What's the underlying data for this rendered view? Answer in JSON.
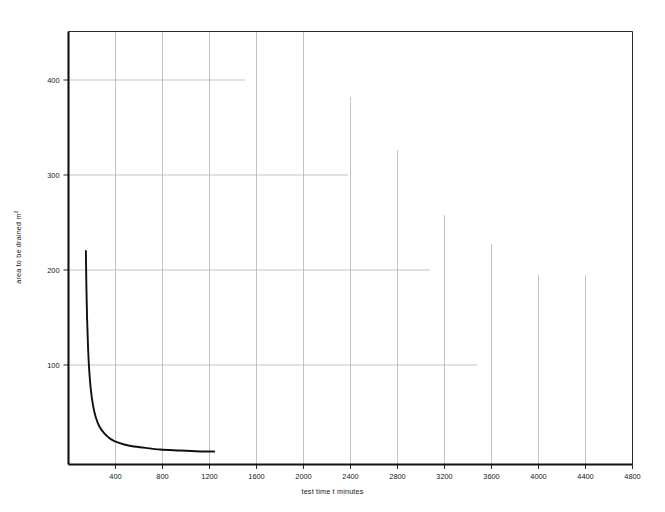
{
  "chart_data": {
    "type": "line",
    "title": "",
    "subtitle": "",
    "xlabel": "test time t minutes",
    "ylabel": "area to be drained m",
    "ylabel_superscript": "2",
    "xlim": [
      0,
      4800
    ],
    "ylim": [
      0,
      455
    ],
    "xticks": [
      400,
      800,
      1200,
      1600,
      2000,
      2400,
      2800,
      3200,
      3600,
      4000,
      4400,
      4800
    ],
    "xtick_labels": [
      "400",
      "800",
      "1200",
      "1600",
      "2000",
      "2400",
      "2800",
      "3200",
      "3600",
      "4000",
      "4400",
      "4800"
    ],
    "yticks": [
      100,
      200,
      300,
      400
    ],
    "ytick_labels": [
      "100",
      "200",
      "300",
      "400"
    ],
    "grid": true,
    "grid_style": "staggered-partial",
    "legend_position": "inline-curve-labels",
    "annotations": [
      {
        "name": "definition-note",
        "text": "D = diameter and effective depth",
        "x": 2750,
        "y": 332
      }
    ],
    "series": [
      {
        "name": "D = 1·0",
        "label": "D=1·0",
        "label_x": 560,
        "label_y": 38,
        "color": "#101010",
        "points": [
          [
            148,
            220
          ],
          [
            152,
            185
          ],
          [
            158,
            150
          ],
          [
            166,
            120
          ],
          [
            176,
            95
          ],
          [
            190,
            74
          ],
          [
            208,
            58
          ],
          [
            232,
            45
          ],
          [
            264,
            35
          ],
          [
            305,
            28
          ],
          [
            360,
            22
          ],
          [
            430,
            18
          ],
          [
            520,
            15
          ],
          [
            640,
            13
          ],
          [
            780,
            11
          ],
          [
            950,
            10
          ],
          [
            1130,
            9
          ],
          [
            1240,
            9
          ]
        ]
      },
      {
        "name": "D = 1·5",
        "label": "D=1·5",
        "label_x": 680,
        "label_y": 62,
        "color": "#101010",
        "points": [
          [
            185,
            285
          ],
          [
            190,
            245
          ],
          [
            197,
            205
          ],
          [
            206,
            170
          ],
          [
            218,
            140
          ],
          [
            234,
            114
          ],
          [
            256,
            92
          ],
          [
            285,
            74
          ],
          [
            322,
            60
          ],
          [
            370,
            49
          ],
          [
            435,
            40
          ],
          [
            520,
            33
          ],
          [
            630,
            28
          ],
          [
            770,
            24
          ],
          [
            950,
            21
          ],
          [
            1180,
            18
          ],
          [
            1480,
            16
          ],
          [
            1850,
            14
          ],
          [
            2300,
            13
          ],
          [
            2800,
            12
          ],
          [
            3300,
            11
          ],
          [
            3550,
            11
          ]
        ]
      },
      {
        "name": "D = 2·0 m",
        "label": "D=2·0m",
        "label_x": 740,
        "label_y": 88,
        "color": "#101010",
        "points": [
          [
            228,
            415
          ],
          [
            234,
            360
          ],
          [
            242,
            310
          ],
          [
            253,
            265
          ],
          [
            268,
            222
          ],
          [
            288,
            184
          ],
          [
            313,
            152
          ],
          [
            345,
            125
          ],
          [
            385,
            103
          ],
          [
            435,
            86
          ],
          [
            498,
            72
          ],
          [
            578,
            61
          ],
          [
            680,
            52
          ],
          [
            810,
            45
          ],
          [
            975,
            39
          ],
          [
            1180,
            34
          ],
          [
            1440,
            30
          ],
          [
            1760,
            27
          ],
          [
            2150,
            24
          ],
          [
            2620,
            22
          ],
          [
            3150,
            20
          ],
          [
            3700,
            19
          ],
          [
            4150,
            18
          ]
        ]
      },
      {
        "name": "D = 2·5 m",
        "label": "D=2·5m",
        "label_x": 800,
        "label_y": 123,
        "color": "#101010",
        "points": [
          [
            268,
            415
          ],
          [
            276,
            365
          ],
          [
            287,
            318
          ],
          [
            302,
            275
          ],
          [
            322,
            235
          ],
          [
            348,
            200
          ],
          [
            380,
            170
          ],
          [
            420,
            145
          ],
          [
            470,
            124
          ],
          [
            532,
            106
          ],
          [
            608,
            91
          ],
          [
            700,
            79
          ],
          [
            812,
            69
          ],
          [
            950,
            61
          ],
          [
            1120,
            54
          ],
          [
            1330,
            48
          ],
          [
            1590,
            43
          ],
          [
            1910,
            39
          ],
          [
            2300,
            36
          ],
          [
            2760,
            33
          ],
          [
            3280,
            31
          ],
          [
            3840,
            29
          ],
          [
            4370,
            28
          ]
        ]
      },
      {
        "name": "D = 3·0 m",
        "label": "D=3·0m",
        "label_x": 845,
        "label_y": 158,
        "color": "#101010",
        "points": [
          [
            320,
            415
          ],
          [
            332,
            370
          ],
          [
            348,
            328
          ],
          [
            368,
            288
          ],
          [
            394,
            252
          ],
          [
            426,
            219
          ],
          [
            466,
            190
          ],
          [
            515,
            165
          ],
          [
            575,
            143
          ],
          [
            648,
            125
          ],
          [
            736,
            109
          ],
          [
            842,
            96
          ],
          [
            970,
            85
          ],
          [
            1125,
            76
          ],
          [
            1312,
            68
          ],
          [
            1540,
            62
          ],
          [
            1815,
            56
          ],
          [
            2150,
            52
          ],
          [
            2550,
            48
          ],
          [
            3030,
            45
          ],
          [
            3600,
            42
          ],
          [
            4200,
            40
          ],
          [
            4550,
            39
          ]
        ]
      },
      {
        "name": "D = 3·5 m",
        "label": "D=3·5m",
        "label_x": 880,
        "label_y": 198,
        "color": "#101010",
        "points": [
          [
            390,
            415
          ],
          [
            406,
            375
          ],
          [
            426,
            338
          ],
          [
            452,
            302
          ],
          [
            484,
            269
          ],
          [
            524,
            238
          ],
          [
            572,
            211
          ],
          [
            630,
            186
          ],
          [
            700,
            165
          ],
          [
            784,
            146
          ],
          [
            884,
            130
          ],
          [
            1004,
            116
          ],
          [
            1148,
            104
          ],
          [
            1320,
            94
          ],
          [
            1525,
            86
          ],
          [
            1770,
            79
          ],
          [
            2060,
            73
          ],
          [
            2405,
            68
          ],
          [
            2815,
            64
          ],
          [
            3300,
            61
          ],
          [
            3875,
            58
          ],
          [
            4400,
            56
          ]
        ]
      }
    ]
  },
  "style": {
    "axis_color": "#101010",
    "grid_color": "#aaaaaa",
    "curve_color": "#101010",
    "text_color": "#161616",
    "background": "#ffffff"
  }
}
